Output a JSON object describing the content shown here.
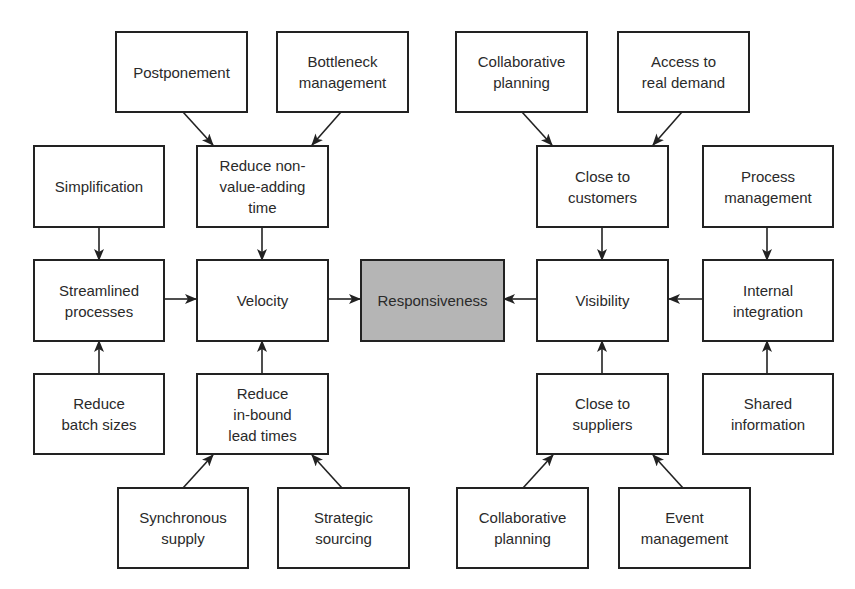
{
  "diagram": {
    "center": {
      "label": "Responsiveness",
      "fill": "#b5b5b5"
    },
    "nodes": {
      "postponement": "Postponement",
      "bottleneck_management": "Bottleneck\nmanagement",
      "simplification": "Simplification",
      "reduce_non_value_adding_time": "Reduce non-\nvalue-adding\ntime",
      "streamlined_processes": "Streamlined\nprocesses",
      "velocity": "Velocity",
      "reduce_batch_sizes": "Reduce\nbatch sizes",
      "reduce_inbound_lead_times": "Reduce\nin-bound\nlead times",
      "synchronous_supply": "Synchronous\nsupply",
      "strategic_sourcing": "Strategic\nsourcing",
      "collaborative_planning_top": "Collaborative\nplanning",
      "access_to_real_demand": "Access to\nreal demand",
      "close_to_customers": "Close to\ncustomers",
      "process_management": "Process\nmanagement",
      "visibility": "Visibility",
      "internal_integration": "Internal\nintegration",
      "close_to_suppliers": "Close to\nsuppliers",
      "shared_information": "Shared\ninformation",
      "collaborative_planning_bottom": "Collaborative\nplanning",
      "event_management": "Event\nmanagement"
    },
    "edges": [
      {
        "from": "postponement",
        "to": "reduce_non_value_adding_time"
      },
      {
        "from": "bottleneck_management",
        "to": "reduce_non_value_adding_time"
      },
      {
        "from": "reduce_non_value_adding_time",
        "to": "velocity"
      },
      {
        "from": "simplification",
        "to": "streamlined_processes"
      },
      {
        "from": "reduce_batch_sizes",
        "to": "streamlined_processes"
      },
      {
        "from": "streamlined_processes",
        "to": "velocity"
      },
      {
        "from": "reduce_inbound_lead_times",
        "to": "velocity"
      },
      {
        "from": "synchronous_supply",
        "to": "reduce_inbound_lead_times"
      },
      {
        "from": "strategic_sourcing",
        "to": "reduce_inbound_lead_times"
      },
      {
        "from": "velocity",
        "to": "responsiveness"
      },
      {
        "from": "visibility",
        "to": "responsiveness"
      },
      {
        "from": "collaborative_planning_top",
        "to": "close_to_customers"
      },
      {
        "from": "access_to_real_demand",
        "to": "close_to_customers"
      },
      {
        "from": "close_to_customers",
        "to": "visibility"
      },
      {
        "from": "process_management",
        "to": "internal_integration"
      },
      {
        "from": "shared_information",
        "to": "internal_integration"
      },
      {
        "from": "internal_integration",
        "to": "visibility"
      },
      {
        "from": "close_to_suppliers",
        "to": "visibility"
      },
      {
        "from": "collaborative_planning_bottom",
        "to": "close_to_suppliers"
      },
      {
        "from": "event_management",
        "to": "close_to_suppliers"
      }
    ]
  }
}
